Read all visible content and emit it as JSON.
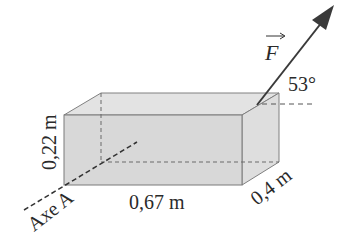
{
  "diagram": {
    "force_label": "F",
    "angle_label": "53°",
    "height_label": "0,22 m",
    "length_label": "0,67 m",
    "depth_label": "0,4 m",
    "axis_label": "Axe A"
  },
  "colors": {
    "box_fill_front": "#d9d9d9",
    "box_fill_top": "#e2e2e2",
    "box_fill_side": "#dcdcdc",
    "edge": "#7a7a7a",
    "arrow": "#3a3a3a",
    "text": "#2a2a2a"
  }
}
